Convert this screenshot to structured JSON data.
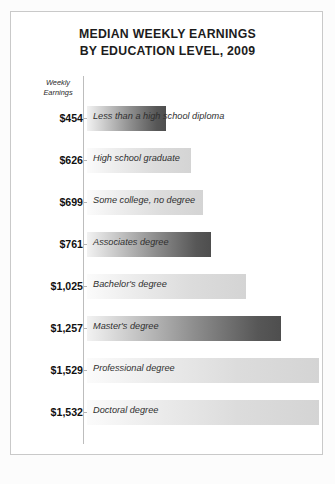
{
  "chart_data": {
    "type": "bar",
    "title": "MEDIAN WEEKLY EARNINGS BY EDUCATION LEVEL, 2009",
    "title_lines": [
      "MEDIAN WEEKLY EARNINGS",
      "BY EDUCATION LEVEL, 2009"
    ],
    "axis_header_lines": [
      "Weekly",
      "Earnings"
    ],
    "xlabel": "",
    "ylabel": "Weekly Earnings",
    "orientation": "horizontal",
    "grid": false,
    "legend": "none",
    "xlim": [
      0,
      1700
    ],
    "categories": [
      "Less than a high school diploma",
      "High school graduate",
      "Some college, no degree",
      "Associates degree",
      "Bachelor's degree",
      "Master's degree",
      "Professional degree",
      "Doctoral degree"
    ],
    "values": [
      454,
      626,
      699,
      761,
      1025,
      1257,
      1529,
      1532
    ],
    "value_labels": [
      "$454",
      "$626",
      "$699",
      "$761",
      "$1,025",
      "$1,257",
      "$1,529",
      "$1,532"
    ],
    "bar_shades": [
      "dark",
      "light",
      "light",
      "dark",
      "light",
      "dark",
      "light",
      "light"
    ],
    "bar_pixel_widths": [
      79,
      104,
      116,
      124,
      159,
      194,
      232,
      232
    ],
    "colors": {
      "text": "#1c1c1c",
      "label_text": "#2f2f2f",
      "axis": "#bdbdbd",
      "bar_dark_end": "#4e4e4e",
      "bar_light_end": "#d4d4d4",
      "panel_border": "#c9c9c9",
      "background": "#ffffff"
    }
  },
  "rows": [
    {
      "value_label": "$454",
      "category": "Less than a high school diploma",
      "shade": "dark",
      "width": 79
    },
    {
      "value_label": "$626",
      "category": "High school graduate",
      "shade": "light",
      "width": 104
    },
    {
      "value_label": "$699",
      "category": "Some college, no degree",
      "shade": "light",
      "width": 116
    },
    {
      "value_label": "$761",
      "category": "Associates degree",
      "shade": "dark",
      "width": 124
    },
    {
      "value_label": "$1,025",
      "category": "Bachelor's degree",
      "shade": "light",
      "width": 159
    },
    {
      "value_label": "$1,257",
      "category": "Master's degree",
      "shade": "dark",
      "width": 194
    },
    {
      "value_label": "$1,529",
      "category": "Professional degree",
      "shade": "light",
      "width": 232
    },
    {
      "value_label": "$1,532",
      "category": "Doctoral degree",
      "shade": "light",
      "width": 232
    }
  ]
}
